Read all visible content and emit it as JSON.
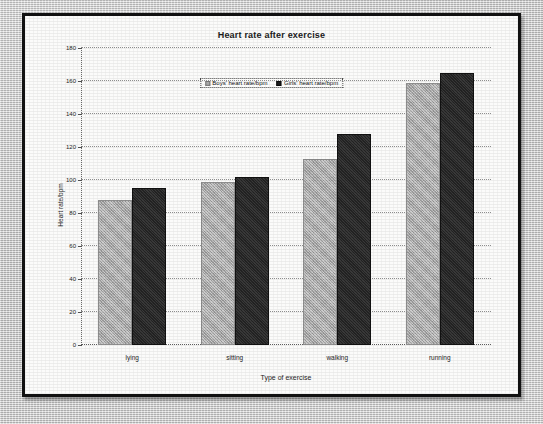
{
  "chart_data": {
    "type": "bar",
    "title": "Heart rate after exercise",
    "xlabel": "Type of exercise",
    "ylabel": "Heart rate/bpm",
    "categories": [
      "lying",
      "sitting",
      "walking",
      "running"
    ],
    "series": [
      {
        "name": "Boys' heart rate/bpm",
        "color": "#a8a8a8",
        "values": [
          88,
          99,
          113,
          159
        ]
      },
      {
        "name": "Girls' heart rate/bpm",
        "color": "#1d1d1d",
        "values": [
          95,
          102,
          128,
          165
        ]
      }
    ],
    "ylim": [
      0,
      180
    ],
    "y_ticks": [
      0,
      20,
      40,
      60,
      80,
      100,
      120,
      140,
      160,
      180
    ],
    "y_tick_labels": [
      "0",
      "20",
      "40",
      "60",
      "80",
      "100",
      "120",
      "140",
      "160",
      "180"
    ],
    "grid": "horizontal-dotted",
    "legend_position": "top-center"
  }
}
